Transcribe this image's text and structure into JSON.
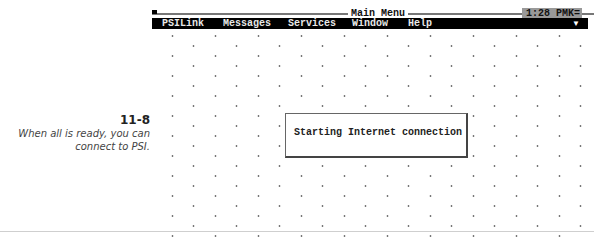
{
  "caption": {
    "figure_number": "11-8",
    "text": "When all is ready, you can connect to PSI."
  },
  "window": {
    "title": "Main Menu",
    "clock": "1:28 PM",
    "clock_suffix": "K="
  },
  "menubar": {
    "items": [
      {
        "label": "PSILink",
        "x": 10
      },
      {
        "label": "Messages",
        "x": 71
      },
      {
        "label": "Services",
        "x": 136
      },
      {
        "label": "Window",
        "x": 200
      },
      {
        "label": "Help",
        "x": 256
      }
    ],
    "dropdown_arrow": "▼"
  },
  "dialog": {
    "message": "Starting Internet connection"
  }
}
